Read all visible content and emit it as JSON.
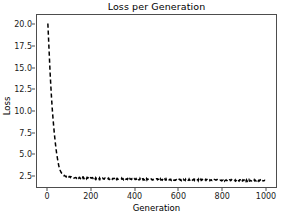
{
  "chart_data": {
    "type": "line",
    "title": "Loss per Generation",
    "xlabel": "Generation",
    "ylabel": "Loss",
    "xlim": [
      -50,
      1050
    ],
    "ylim": [
      1.1,
      21.2
    ],
    "grid": false,
    "legend": null,
    "line_style": "dashed",
    "line_color": "#000000",
    "series": [
      {
        "name": "Loss",
        "x": [
          0,
          5,
          10,
          15,
          20,
          25,
          30,
          35,
          40,
          45,
          50,
          55,
          60,
          65,
          70,
          80,
          90,
          100,
          120,
          140,
          160,
          180,
          200,
          220,
          240,
          260,
          280,
          300,
          320,
          340,
          360,
          380,
          400,
          420,
          440,
          460,
          480,
          500,
          520,
          540,
          560,
          580,
          600,
          620,
          640,
          660,
          680,
          700,
          720,
          740,
          760,
          780,
          800,
          820,
          840,
          860,
          880,
          900,
          920,
          940,
          960,
          980,
          1000
        ],
        "values": [
          20.2,
          17.4,
          14.6,
          12.3,
          10.3,
          8.7,
          7.3,
          6.1,
          5.1,
          4.3,
          3.6,
          3.15,
          2.85,
          2.65,
          2.5,
          2.35,
          2.28,
          2.24,
          2.2,
          2.18,
          2.16,
          2.14,
          2.13,
          2.12,
          2.1,
          2.09,
          2.08,
          2.07,
          2.06,
          2.05,
          2.04,
          2.03,
          2.02,
          2.01,
          2.0,
          1.99,
          1.99,
          1.98,
          1.97,
          1.97,
          1.96,
          1.95,
          1.95,
          1.94,
          1.93,
          1.93,
          1.92,
          1.92,
          1.91,
          1.91,
          1.9,
          1.9,
          1.89,
          1.89,
          1.88,
          1.88,
          1.87,
          1.87,
          1.86,
          1.86,
          1.86,
          1.85,
          1.85
        ]
      }
    ],
    "xticks": [
      0,
      200,
      400,
      600,
      800,
      1000
    ],
    "xtick_labels": [
      "0",
      "200",
      "400",
      "600",
      "800",
      "1000"
    ],
    "yticks": [
      2.5,
      5.0,
      7.5,
      10.0,
      12.5,
      15.0,
      17.5,
      20.0
    ],
    "ytick_labels": [
      "2.5",
      "5.0",
      "7.5",
      "10.0",
      "12.5",
      "15.0",
      "17.5",
      "20.0"
    ]
  }
}
